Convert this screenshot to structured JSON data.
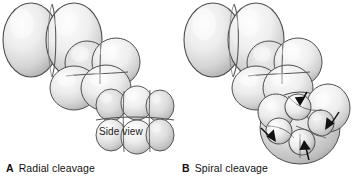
{
  "figure": {
    "background_color": "#ffffff",
    "width": 352,
    "height": 180
  },
  "panels": [
    {
      "id": "a",
      "letter": "A",
      "caption": "Radial cleavage",
      "inline_labels": [
        {
          "name": "side-view",
          "text": "Side view"
        }
      ],
      "stages": [
        {
          "name": "two-cell-stage",
          "cell_count": 2
        },
        {
          "name": "four-cell-stage",
          "cell_count": 4
        },
        {
          "name": "eight-cell-stage",
          "cell_count": 8
        }
      ],
      "arrow_count": 0
    },
    {
      "id": "b",
      "letter": "B",
      "caption": "Spiral cleavage",
      "inline_labels": [],
      "stages": [
        {
          "name": "two-cell-stage",
          "cell_count": 2
        },
        {
          "name": "four-cell-stage",
          "cell_count": 4
        },
        {
          "name": "eight-cell-stage",
          "cell_count": 8
        }
      ],
      "arrow_count": 4
    }
  ],
  "colors": {
    "cell_light": "#f4f4f4",
    "cell_mid": "#d2d2d2",
    "cell_shadow": "#9a9a9a",
    "outline": "#4a4a4a",
    "arrow": "#111111",
    "text": "#111111"
  }
}
